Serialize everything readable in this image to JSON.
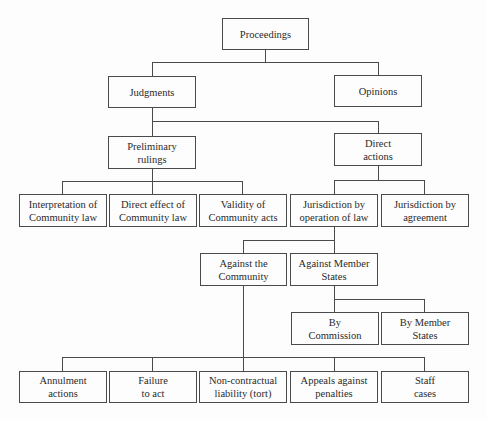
{
  "diagram": {
    "type": "tree",
    "nodes": {
      "proceedings": "Proceedings",
      "judgments": "Judgments",
      "opinions": "Opinions",
      "preliminary_rulings": "Preliminary\nrulings",
      "direct_actions": "Direct\nactions",
      "interpretation": "Interpretation of\nCommunity law",
      "direct_effect": "Direct effect of\nCommunity law",
      "validity": "Validity of\nCommunity acts",
      "jurisdiction_operation": "Jurisdiction by\noperation of law",
      "jurisdiction_agreement": "Jurisdiction by\nagreement",
      "against_community": "Against the\nCommunity",
      "against_member_states": "Against Member\nStates",
      "by_commission": "By\nCommission",
      "by_member_states": "By Member\nStates",
      "annulment": "Annulment\nactions",
      "failure": "Failure\nto act",
      "non_contractual": "Non-contractual\nliability (tort)",
      "appeals": "Appeals against\npenalties",
      "staff": "Staff\ncases"
    },
    "edges": [
      [
        "proceedings",
        "judgments"
      ],
      [
        "proceedings",
        "opinions"
      ],
      [
        "judgments",
        "preliminary_rulings"
      ],
      [
        "judgments",
        "direct_actions"
      ],
      [
        "preliminary_rulings",
        "interpretation"
      ],
      [
        "preliminary_rulings",
        "direct_effect"
      ],
      [
        "preliminary_rulings",
        "validity"
      ],
      [
        "direct_actions",
        "jurisdiction_operation"
      ],
      [
        "direct_actions",
        "jurisdiction_agreement"
      ],
      [
        "jurisdiction_operation",
        "against_community"
      ],
      [
        "jurisdiction_operation",
        "against_member_states"
      ],
      [
        "against_member_states",
        "by_commission"
      ],
      [
        "against_member_states",
        "by_member_states"
      ],
      [
        "against_community",
        "annulment"
      ],
      [
        "against_community",
        "failure"
      ],
      [
        "against_community",
        "non_contractual"
      ],
      [
        "against_community",
        "appeals"
      ],
      [
        "against_community",
        "staff"
      ]
    ]
  }
}
